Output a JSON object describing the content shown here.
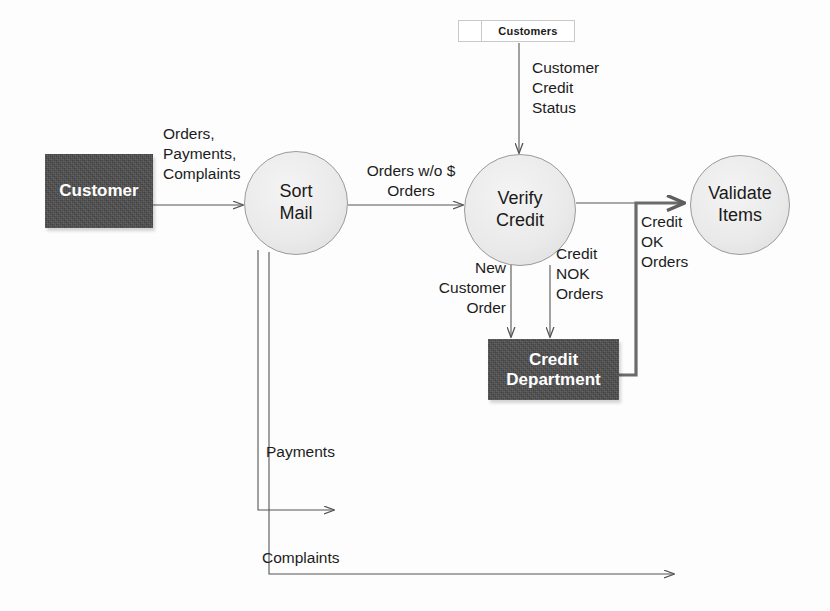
{
  "diagram": {
    "type": "data-flow-diagram",
    "colors": {
      "entity_fill": "#4c4c4c",
      "entity_text": "#ffffff",
      "process_fill": "#eaeaea",
      "process_stroke": "#9a9a9a",
      "flow_stroke": "#555555",
      "thick_flow_stroke": "#6b6b6b",
      "label_text": "#1c1c1c",
      "background": "#fdfdfd"
    }
  },
  "entities": [
    {
      "id": "customer",
      "label": "Customer"
    },
    {
      "id": "credit_department",
      "label_line1": "Credit",
      "label_line2": "Department"
    }
  ],
  "processes": [
    {
      "id": "sort_mail",
      "line1": "Sort",
      "line2": "Mail"
    },
    {
      "id": "verify_credit",
      "line1": "Verify",
      "line2": "Credit"
    },
    {
      "id": "validate_items",
      "line1": "Validate",
      "line2": "Items"
    }
  ],
  "datastores": [
    {
      "id": "customers",
      "label": "Customers"
    }
  ],
  "flows": [
    {
      "id": "customer_to_sort_mail",
      "label": "Orders,\nPayments,\nComplaints",
      "from": "customer",
      "to": "sort_mail"
    },
    {
      "id": "sort_mail_to_verify_credit",
      "label": "Orders w/o $\nOrders",
      "from": "sort_mail",
      "to": "verify_credit"
    },
    {
      "id": "customers_to_verify_credit",
      "label": "Customer\nCredit\nStatus",
      "from": "customers",
      "to": "verify_credit"
    },
    {
      "id": "verify_credit_to_credit_department_new",
      "label": "New\nCustomer\nOrder",
      "from": "verify_credit",
      "to": "credit_department"
    },
    {
      "id": "verify_credit_to_credit_department_nok",
      "label": "Credit\nNOK\nOrders",
      "from": "verify_credit",
      "to": "credit_department"
    },
    {
      "id": "credit_ok_to_validate_items",
      "label": "Credit\nOK\nOrders",
      "from": "credit_department",
      "to": "validate_items"
    },
    {
      "id": "sort_mail_payments",
      "label": "Payments",
      "from": "sort_mail",
      "to": ""
    },
    {
      "id": "sort_mail_complaints",
      "label": "Complaints",
      "from": "sort_mail",
      "to": ""
    }
  ]
}
